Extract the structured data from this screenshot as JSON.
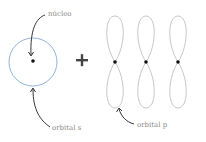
{
  "diagram": {
    "labels": {
      "nucleus": "núcleo",
      "orbital_s": "orbital s",
      "orbital_p": "orbital p"
    },
    "operator": "+",
    "colors": {
      "s_orbital_stroke": "#8fb5dc",
      "p_orbital_stroke": "#c8c8c8",
      "nucleus_dot": "#111111",
      "arrow": "#333333",
      "label_text": "#8a8a8a",
      "plus": "#444444"
    },
    "p_orbital_count": 3
  }
}
